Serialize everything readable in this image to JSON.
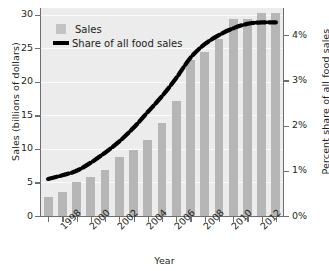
{
  "chart_data": {
    "type": "bar",
    "title": "",
    "subtitle": "",
    "xlabel": "Year",
    "ylabel": "Sales (billions of dollars)",
    "ylabel_right": "Percent share of all food sales",
    "grid": true,
    "legend_position": "top-left",
    "ylim": [
      0,
      31
    ],
    "ylim_right": [
      0,
      4.6
    ],
    "x": [
      1997,
      1998,
      1999,
      2000,
      2001,
      2002,
      2003,
      2004,
      2005,
      2006,
      2007,
      2008,
      2009,
      2010,
      2011,
      2012,
      2013
    ],
    "categories": [
      "1997",
      "1998",
      "1999",
      "2000",
      "2001",
      "2002",
      "2003",
      "2004",
      "2005",
      "2006",
      "2007",
      "2008",
      "2009",
      "2010",
      "2011",
      "2012",
      "2013"
    ],
    "xtick_labels": [
      "1998",
      "2000",
      "2002",
      "2004",
      "2006",
      "2008",
      "2010",
      "2012"
    ],
    "xtick_years": [
      1998,
      2000,
      2002,
      2004,
      2006,
      2008,
      2010,
      2012
    ],
    "ytick_labels_left": [
      "0",
      "5",
      "10",
      "15",
      "20",
      "25",
      "30"
    ],
    "ytick_values_left": [
      0,
      5,
      10,
      15,
      20,
      25,
      30
    ],
    "ytick_labels_right": [
      "0%",
      "1%",
      "2%",
      "3%",
      "4%"
    ],
    "ytick_values_right": [
      0,
      1,
      2,
      3,
      4
    ],
    "series": [
      {
        "name": "Sales",
        "type": "bar",
        "axis": "left",
        "unit": "billions of dollars",
        "color": "#b6b6b6",
        "values": [
          2.8,
          3.6,
          5.0,
          5.8,
          6.9,
          8.8,
          9.9,
          11.3,
          13.9,
          17.2,
          23.3,
          24.5,
          26.4,
          29.4,
          29.3,
          30.3,
          30.3
        ]
      },
      {
        "name": "Share of all food sales",
        "type": "line",
        "axis": "right",
        "unit": "percent",
        "color": "#000000",
        "style": "dashed-thick",
        "values": [
          0.82,
          0.9,
          1.0,
          1.18,
          1.4,
          1.65,
          1.95,
          2.3,
          2.65,
          3.05,
          3.5,
          3.8,
          4.0,
          4.15,
          4.25,
          4.28,
          4.28
        ]
      }
    ]
  },
  "legend": {
    "items": [
      {
        "label": "Sales",
        "marker": "square"
      },
      {
        "label": "Share of all food sales",
        "marker": "line"
      }
    ]
  },
  "colors": {
    "bar": "#b6b6b6",
    "line": "#000000",
    "plot_background": "#ececec",
    "gridline": "#fbfbfb",
    "axis": "#6d6e71",
    "text": "#231f20"
  }
}
